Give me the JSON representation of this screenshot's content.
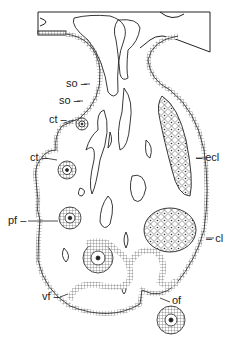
{
  "figure": {
    "type": "histological line drawing — ovary section",
    "labels": [
      {
        "id": "so1",
        "text": "so",
        "x": 66,
        "y": 78
      },
      {
        "id": "so2",
        "text": "so",
        "x": 59,
        "y": 95
      },
      {
        "id": "ct1",
        "text": "ct",
        "x": 49,
        "y": 117
      },
      {
        "id": "ct2",
        "text": "ct",
        "x": 31,
        "y": 152
      },
      {
        "id": "pf",
        "text": "pf",
        "x": 12,
        "y": 215
      },
      {
        "id": "ecl",
        "text": "ecl",
        "x": 210,
        "y": 152
      },
      {
        "id": "cl",
        "text": "cl",
        "x": 218,
        "y": 233
      },
      {
        "id": "vf",
        "text": "vf",
        "x": 45,
        "y": 291
      },
      {
        "id": "of",
        "text": "of",
        "x": 172,
        "y": 295
      }
    ],
    "label_texts": {
      "so1": "so – ",
      "so2": "so – ",
      "ct1": "ct – ",
      "ct2": "ct – ",
      "pf": "pf – ",
      "ecl": "– ecl",
      "cl": "– cl",
      "vf": "vf –",
      "of": "of"
    }
  }
}
